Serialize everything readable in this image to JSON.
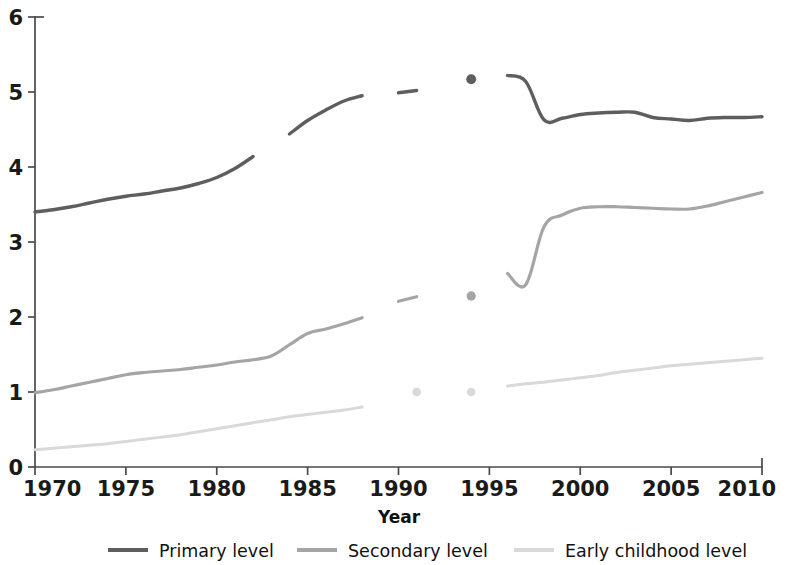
{
  "chart_data": {
    "type": "line",
    "title": "",
    "xlabel": "Year",
    "ylabel": "",
    "xlim": [
      1970,
      2010
    ],
    "ylim": [
      0,
      6
    ],
    "grid": false,
    "legend_position": "bottom",
    "x_ticks": [
      "1970",
      "1975",
      "1980",
      "1985",
      "1990",
      "1995",
      "2000",
      "2005",
      "2010"
    ],
    "x_tick_values": [
      1970,
      1975,
      1980,
      1985,
      1990,
      1995,
      2000,
      2005,
      2010
    ],
    "y_ticks": [
      "0",
      "1",
      "2",
      "3",
      "4",
      "5",
      "6"
    ],
    "y_tick_values": [
      0,
      1,
      2,
      3,
      4,
      5,
      6
    ],
    "series": [
      {
        "name": "Primary level",
        "color": "#5e5e5e",
        "width": 3.4,
        "segments": [
          {
            "x": [
              1970,
              1971,
              1972,
              1973,
              1974,
              1975,
              1976,
              1977,
              1978,
              1979,
              1980,
              1981,
              1982
            ],
            "values": [
              3.4,
              3.43,
              3.47,
              3.52,
              3.57,
              3.61,
              3.64,
              3.68,
              3.72,
              3.78,
              3.86,
              3.98,
              4.14
            ]
          },
          {
            "x": [
              1984,
              1985,
              1986,
              1987,
              1988
            ],
            "values": [
              4.44,
              4.62,
              4.76,
              4.88,
              4.95
            ]
          },
          {
            "x": [
              1990,
              1991
            ],
            "values": [
              4.99,
              5.02
            ]
          },
          {
            "x": [
              1996,
              1997,
              1998,
              1999,
              2000,
              2001,
              2002,
              2003,
              2004,
              2005,
              2006,
              2007,
              2008,
              2009,
              2010
            ],
            "values": [
              5.22,
              5.14,
              4.63,
              4.65,
              4.7,
              4.72,
              4.73,
              4.73,
              4.66,
              4.64,
              4.62,
              4.65,
              4.66,
              4.66,
              4.67
            ]
          }
        ],
        "points": [
          {
            "x": 1994,
            "value": 5.17
          }
        ]
      },
      {
        "name": "Secondary level",
        "color": "#a5a5a5",
        "width": 3.2,
        "segments": [
          {
            "x": [
              1970,
              1971,
              1972,
              1973,
              1974,
              1975,
              1976,
              1977,
              1978,
              1979,
              1980,
              1981,
              1982,
              1983,
              1984,
              1985,
              1986,
              1987,
              1988
            ],
            "values": [
              0.99,
              1.03,
              1.08,
              1.13,
              1.18,
              1.23,
              1.26,
              1.28,
              1.3,
              1.33,
              1.36,
              1.4,
              1.43,
              1.48,
              1.63,
              1.78,
              1.84,
              1.91,
              1.99
            ]
          },
          {
            "x": [
              1990,
              1991
            ],
            "values": [
              2.21,
              2.27
            ]
          },
          {
            "x": [
              1996,
              1997,
              1998,
              1999,
              2000,
              2001,
              2002,
              2003,
              2004,
              2005,
              2006,
              2007,
              2008,
              2009,
              2010
            ],
            "values": [
              2.58,
              2.43,
              3.2,
              3.36,
              3.45,
              3.47,
              3.47,
              3.46,
              3.45,
              3.44,
              3.44,
              3.48,
              3.54,
              3.6,
              3.66
            ]
          }
        ],
        "points": [
          {
            "x": 1994,
            "value": 2.28
          }
        ]
      },
      {
        "name": "Early childhood level",
        "color": "#d9d9d9",
        "width": 3.0,
        "segments": [
          {
            "x": [
              1970,
              1971,
              1972,
              1973,
              1974,
              1975,
              1976,
              1977,
              1978,
              1979,
              1980,
              1981,
              1982,
              1983,
              1984,
              1985,
              1986,
              1987,
              1988
            ],
            "values": [
              0.23,
              0.25,
              0.27,
              0.29,
              0.31,
              0.34,
              0.37,
              0.4,
              0.43,
              0.47,
              0.51,
              0.55,
              0.59,
              0.63,
              0.67,
              0.7,
              0.73,
              0.76,
              0.8
            ]
          },
          {
            "x": [
              1996,
              1997,
              1998,
              1999,
              2000,
              2001,
              2002,
              2003,
              2004,
              2005,
              2006,
              2007,
              2008,
              2009,
              2010
            ],
            "values": [
              1.08,
              1.11,
              1.13,
              1.16,
              1.19,
              1.22,
              1.26,
              1.29,
              1.32,
              1.35,
              1.37,
              1.39,
              1.41,
              1.43,
              1.45
            ]
          }
        ],
        "points": [
          {
            "x": 1991,
            "value": 1.0
          },
          {
            "x": 1994,
            "value": 1.0
          }
        ]
      }
    ]
  },
  "axes": {
    "x_title": "Year"
  },
  "legend": {
    "items": [
      {
        "label": "Primary level",
        "color": "#5e5e5e"
      },
      {
        "label": "Secondary level",
        "color": "#a5a5a5"
      },
      {
        "label": "Early childhood level",
        "color": "#d9d9d9"
      }
    ]
  }
}
